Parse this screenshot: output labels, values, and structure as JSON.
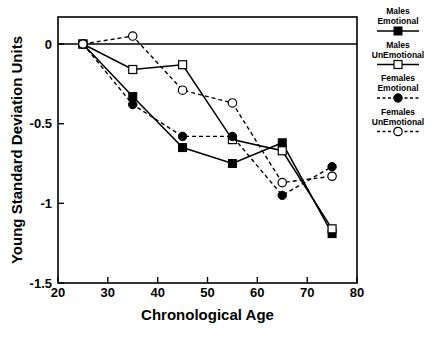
{
  "chart_data": {
    "type": "line",
    "title": "",
    "xlabel": "Chronological Age",
    "ylabel": "Young Standard Deviation Units",
    "xlim": [
      20,
      80
    ],
    "ylim": [
      -1.5,
      0.25
    ],
    "xticks": [
      "20",
      "30",
      "40",
      "50",
      "60",
      "70",
      "80"
    ],
    "xtick_values": [
      20,
      30,
      40,
      50,
      60,
      70,
      80
    ],
    "yticks": [
      "0",
      "-0.5",
      "-1",
      "-1.5"
    ],
    "ytick_values": [
      0,
      -0.5,
      -1,
      -1.5
    ],
    "grid": false,
    "legend_position": "right",
    "x": [
      25,
      35,
      45,
      55,
      65,
      75
    ],
    "series": [
      {
        "name": "Males Emotional",
        "label_line1": "Males",
        "label_line2": "Emotional",
        "marker": "filled-square",
        "line": "solid",
        "color": "#000000",
        "values": [
          0.0,
          -0.33,
          -0.65,
          -0.75,
          -0.62,
          -1.19
        ]
      },
      {
        "name": "Males UnEmotional",
        "label_line1": "Males",
        "label_line2": "UnEmotional",
        "marker": "open-square",
        "line": "solid",
        "color": "#000000",
        "values": [
          0.0,
          -0.16,
          -0.13,
          -0.6,
          -0.67,
          -1.16
        ]
      },
      {
        "name": "Females Emotional",
        "label_line1": "Females",
        "label_line2": "Emotional",
        "marker": "filled-circle",
        "line": "dashed",
        "color": "#000000",
        "values": [
          0.0,
          -0.38,
          -0.58,
          -0.58,
          -0.95,
          -0.77
        ]
      },
      {
        "name": "Females UnEmotional",
        "label_line1": "Females",
        "label_line2": "UnEmotional",
        "marker": "open-circle",
        "line": "dashed",
        "color": "#000000",
        "values": [
          0.0,
          0.05,
          -0.29,
          -0.37,
          -0.87,
          -0.83
        ]
      }
    ]
  },
  "legend": {
    "entries": [
      {
        "line1": "Males",
        "line2": "Emotional"
      },
      {
        "line1": "Males",
        "line2": "UnEmotional"
      },
      {
        "line1": "Females",
        "line2": "Emotional"
      },
      {
        "line1": "Females",
        "line2": "UnEmotional"
      }
    ]
  },
  "axes": {
    "x_title": "Chronological Age",
    "y_title": "Young Standard Deviation Units",
    "x_tick_labels": [
      "20",
      "30",
      "40",
      "50",
      "60",
      "70",
      "80"
    ],
    "y_tick_labels": [
      "0",
      "-0.5",
      "-1",
      "-1.5"
    ]
  }
}
